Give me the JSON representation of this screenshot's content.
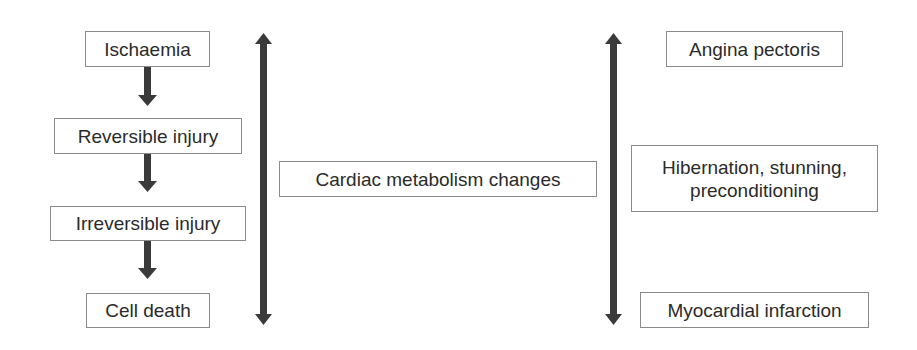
{
  "diagram": {
    "type": "flowchart",
    "colors": {
      "arrow": "#3a3a3a",
      "box_border": "#8a8a8a",
      "text": "#2b2b2b",
      "background": "#ffffff"
    },
    "left_sequence": [
      {
        "id": "ischaemia",
        "label": "Ischaemia"
      },
      {
        "id": "reversible-injury",
        "label": "Reversible injury"
      },
      {
        "id": "irreversible-injury",
        "label": "Irreversible injury"
      },
      {
        "id": "cell-death",
        "label": "Cell death"
      }
    ],
    "center": {
      "id": "cardiac-metabolism",
      "label": "Cardiac metabolism changes"
    },
    "right_outcomes": [
      {
        "id": "angina-pectoris",
        "label": "Angina pectoris"
      },
      {
        "id": "hibernation",
        "label": "Hibernation, stunning,\npreconditioning"
      },
      {
        "id": "myocardial-infarction",
        "label": "Myocardial infarction"
      }
    ],
    "connectors": [
      {
        "from": "ischaemia",
        "to": "reversible-injury",
        "type": "down-arrow"
      },
      {
        "from": "reversible-injury",
        "to": "irreversible-injury",
        "type": "down-arrow"
      },
      {
        "from": "irreversible-injury",
        "to": "cell-death",
        "type": "down-arrow"
      },
      {
        "position": "left-of-center",
        "type": "double-headed-vertical-arrow"
      },
      {
        "position": "right-of-center",
        "type": "double-headed-vertical-arrow"
      }
    ]
  }
}
